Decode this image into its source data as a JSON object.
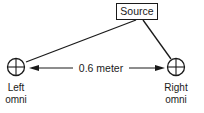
{
  "diagram": {
    "source": {
      "label": "Source"
    },
    "distance": {
      "label": "0.6 meter"
    },
    "left_mic": {
      "line1": "Left",
      "line2": "omni"
    },
    "right_mic": {
      "line1": "Right",
      "line2": "omni"
    },
    "colors": {
      "stroke": "#1a1a1a",
      "background": "#ffffff"
    }
  }
}
